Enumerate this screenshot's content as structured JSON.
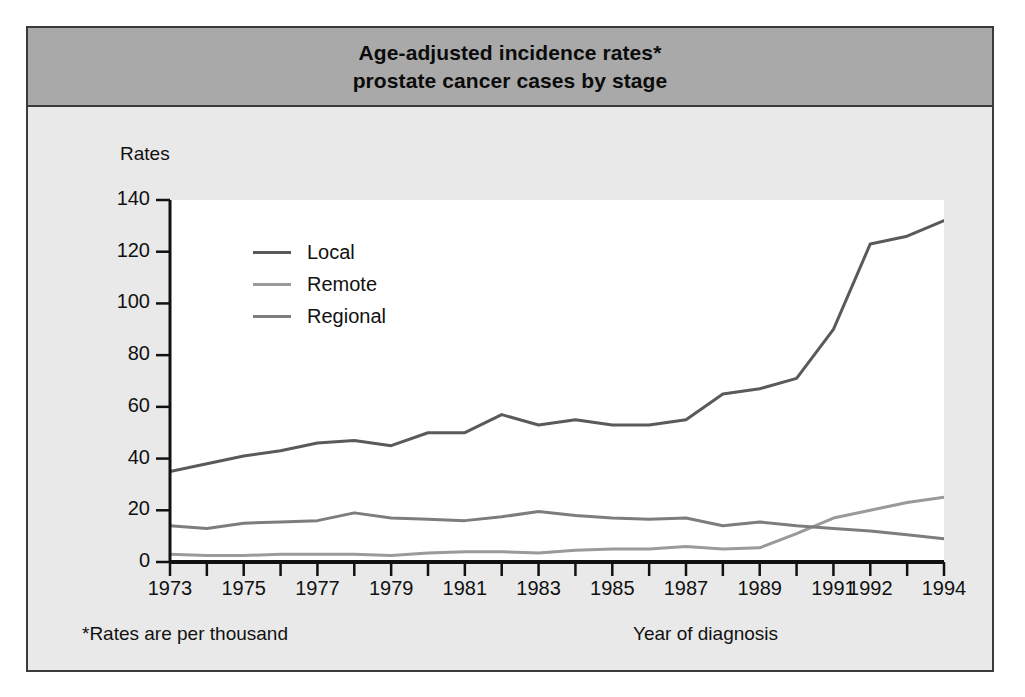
{
  "figure": {
    "title_line1": "Age-adjusted incidence rates*",
    "title_line2": "prostate cancer cases by stage",
    "footnote": "*Rates are per thousand",
    "colors": {
      "title_band": "#a9a9a9",
      "body_background": "#e9e9e9",
      "plot_background": "#ffffff",
      "frame_border": "#3a3a3a",
      "axis": "#111111",
      "local_line": "#5a5a5a",
      "remote_line": "#9a9a9a",
      "regional_line": "#7d7d7d"
    }
  },
  "chart_data": {
    "type": "line",
    "title": "Age-adjusted incidence rates* prostate cancer cases by stage",
    "xlabel": "Year of diagnosis",
    "ylabel": "Rates",
    "xlim": [
      1973,
      1994
    ],
    "ylim": [
      0,
      140
    ],
    "yticks": [
      0,
      20,
      40,
      60,
      80,
      100,
      120,
      140
    ],
    "ytick_labels": [
      "0",
      "20",
      "40",
      "60",
      "80",
      "100",
      "120",
      "140"
    ],
    "x": [
      1973,
      1974,
      1975,
      1976,
      1977,
      1978,
      1979,
      1980,
      1981,
      1982,
      1983,
      1984,
      1985,
      1986,
      1987,
      1988,
      1989,
      1990,
      1991,
      1992,
      1993,
      1994
    ],
    "xtick_labels": [
      "1973",
      "",
      "1975",
      "",
      "1977",
      "",
      "1979",
      "",
      "1981",
      "",
      "1983",
      "",
      "1985",
      "",
      "1987",
      "",
      "1989",
      "",
      "1991",
      "1992",
      "",
      "1994"
    ],
    "grid": false,
    "legend_position": "upper-left-inside",
    "series": [
      {
        "name": "Local",
        "color": "#5a5a5a",
        "values": [
          35,
          38,
          41,
          43,
          46,
          47,
          45,
          50,
          50,
          57,
          53,
          55,
          53,
          53,
          55,
          65,
          67,
          71,
          90,
          123,
          126,
          132
        ]
      },
      {
        "name": "Remote",
        "color": "#9a9a9a",
        "values": [
          3,
          2.5,
          2.5,
          3,
          3,
          3,
          2.5,
          3.5,
          4,
          4,
          3.5,
          4.5,
          5,
          5,
          6,
          5,
          5.5,
          11,
          17,
          20,
          23,
          25
        ]
      },
      {
        "name": "Regional",
        "color": "#7d7d7d",
        "values": [
          14,
          13,
          15,
          15.5,
          16,
          19,
          17,
          16.5,
          16,
          17.5,
          19.5,
          18,
          17,
          16.5,
          17,
          14,
          15.5,
          14,
          13,
          12,
          10.5,
          9
        ]
      }
    ]
  }
}
